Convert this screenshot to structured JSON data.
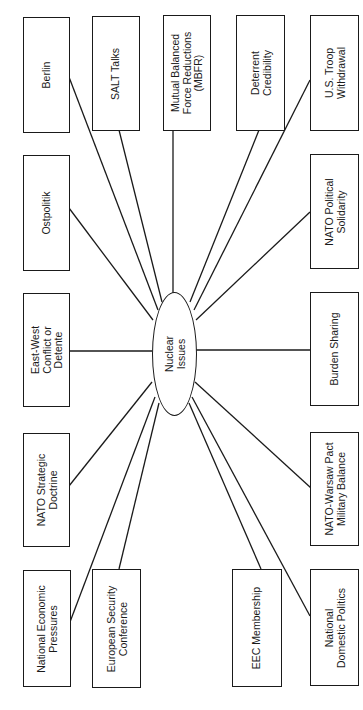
{
  "diagram": {
    "hub": {
      "lines": [
        "Nuclear",
        "Issues"
      ]
    },
    "nodes": [
      {
        "id": "berlin",
        "lines": [
          "Berlin"
        ]
      },
      {
        "id": "salt",
        "lines": [
          "SALT Talks"
        ]
      },
      {
        "id": "mbfr",
        "lines": [
          "Mutual Balanced",
          "Force Reductions",
          "(MBFR)"
        ]
      },
      {
        "id": "deterrent",
        "lines": [
          "Deterrent",
          "Credibility"
        ]
      },
      {
        "id": "us_troop",
        "lines": [
          "U.S. Troop",
          "Withdrawal"
        ]
      },
      {
        "id": "ostpolitik",
        "lines": [
          "Ostpolitik"
        ]
      },
      {
        "id": "nato_political",
        "lines": [
          "NATO Political",
          "Solidarity"
        ]
      },
      {
        "id": "east_west",
        "lines": [
          "East-West",
          "Conflict or",
          "Detente"
        ]
      },
      {
        "id": "burden",
        "lines": [
          "Burden Sharing"
        ]
      },
      {
        "id": "nato_strategic",
        "lines": [
          "NATO Strategic",
          "Doctrine"
        ]
      },
      {
        "id": "nato_warsaw",
        "lines": [
          "NATO-Warsaw Pact",
          "Military Balance"
        ]
      },
      {
        "id": "national_economic",
        "lines": [
          "National Economic",
          "Pressures"
        ]
      },
      {
        "id": "european_security",
        "lines": [
          "European Security",
          "Conference"
        ]
      },
      {
        "id": "eec",
        "lines": [
          "EEC Membership"
        ]
      },
      {
        "id": "national_domestic",
        "lines": [
          "National",
          "Domestic Politics"
        ]
      }
    ],
    "edges": [
      [
        "hub",
        "berlin"
      ],
      [
        "hub",
        "salt"
      ],
      [
        "hub",
        "mbfr"
      ],
      [
        "hub",
        "deterrent"
      ],
      [
        "hub",
        "us_troop"
      ],
      [
        "hub",
        "ostpolitik"
      ],
      [
        "hub",
        "nato_political"
      ],
      [
        "hub",
        "east_west"
      ],
      [
        "hub",
        "burden"
      ],
      [
        "hub",
        "nato_strategic"
      ],
      [
        "hub",
        "nato_warsaw"
      ],
      [
        "hub",
        "national_economic"
      ],
      [
        "hub",
        "european_security"
      ],
      [
        "hub",
        "eec"
      ],
      [
        "hub",
        "national_domestic"
      ]
    ],
    "line_color": "#1a1a1a",
    "orientation": "rotated 90° counter-clockwise"
  }
}
